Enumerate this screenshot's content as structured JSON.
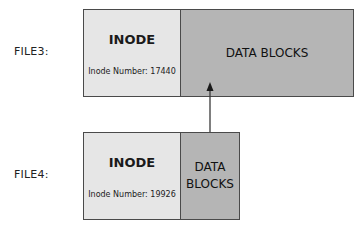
{
  "diagram": {
    "files": [
      {
        "label": "FILE3:",
        "inode_title": "INODE",
        "inode_number": "Inode Number: 17440",
        "data_blocks": "DATA BLOCKS"
      },
      {
        "label": "FILE4:",
        "inode_title": "INODE",
        "inode_number": "Inode Number: 19926",
        "data_blocks_line1": "DATA",
        "data_blocks_line2": "BLOCKS"
      }
    ],
    "arrow": {
      "from": "FILE4 data blocks",
      "to": "FILE3 data blocks"
    },
    "colors": {
      "inode_fill": "#e6e6e6",
      "data_fill": "#b5b5b5",
      "border": "#4a4a4a",
      "arrow": "#3a3a3a"
    }
  }
}
